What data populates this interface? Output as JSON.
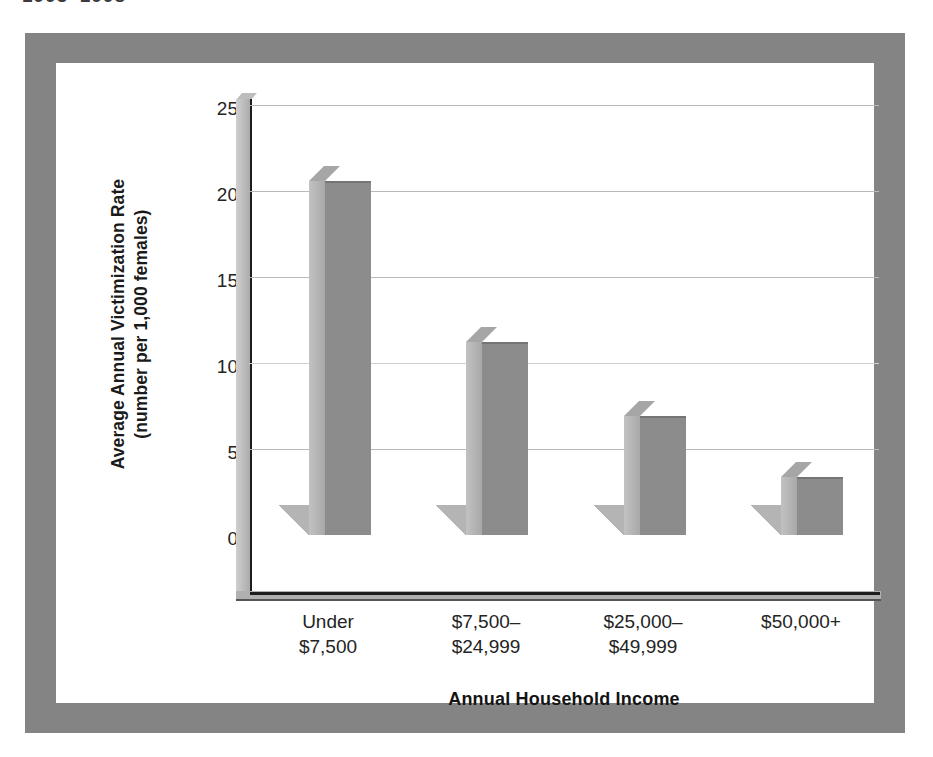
{
  "page": {
    "cropped_header_text": "1993–1998"
  },
  "chart_data": {
    "type": "bar",
    "title": "",
    "xlabel": "Annual Household Income",
    "ylabel": "Average Annual Victimization Rate (number per 1,000 females)",
    "ylabel_line1": "Average Annual Victimization Rate",
    "ylabel_line2": "(number per 1,000 females)",
    "categories": [
      "Under $7,500",
      "$7,500–$24,999",
      "$25,000–$49,999",
      "$50,000+"
    ],
    "category_lines": [
      [
        "Under",
        "$7,500"
      ],
      [
        "$7,500–",
        "$24,999"
      ],
      [
        "$25,000–",
        "$49,999"
      ],
      [
        "$50,000+",
        ""
      ]
    ],
    "values": [
      20.6,
      11.2,
      6.9,
      3.4
    ],
    "ylim": [
      0,
      25
    ],
    "ytick_labels": [
      "25",
      "20",
      "15",
      "10",
      "5",
      "0"
    ],
    "ytick_values": [
      25,
      20,
      15,
      10,
      5,
      0
    ],
    "grid": true,
    "legend": false,
    "colors": {
      "bar_front": "#8c8c8c",
      "bar_side": "#b5b5b5",
      "bar_top": "#a6a6a6",
      "shadow": "#b4b4b4",
      "gridline": "#b9b9b9",
      "axis": "#1d1d1d",
      "frame": "#848484",
      "background": "#ffffff",
      "text": "#242424"
    }
  }
}
